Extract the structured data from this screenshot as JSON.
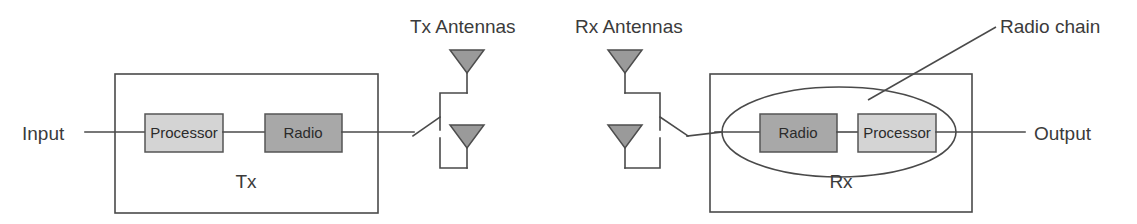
{
  "diagram": {
    "colors": {
      "background": "#ffffff",
      "line": "#4a4a4a",
      "text": "#3b3b3b",
      "processor_fill": "#d4d4d4",
      "radio_fill": "#a8a8a8",
      "antenna_fill": "#9a9a9a",
      "block_border": "#555555"
    }
  },
  "tx": {
    "input_label": "Input",
    "enclosure_label": "Tx",
    "antennas_label": "Tx Antennas",
    "blocks": [
      {
        "label": "Processor",
        "fill": "#d4d4d4"
      },
      {
        "label": "Radio",
        "fill": "#a8a8a8"
      }
    ],
    "antennas": [
      {
        "name": "tx-antenna-1"
      },
      {
        "name": "tx-antenna-2"
      }
    ]
  },
  "rx": {
    "output_label": "Output",
    "enclosure_label": "Rx",
    "antennas_label": "Rx Antennas",
    "chain_label": "Radio chain",
    "blocks": [
      {
        "label": "Radio",
        "fill": "#a8a8a8"
      },
      {
        "label": "Processor",
        "fill": "#d4d4d4"
      }
    ],
    "antennas": [
      {
        "name": "rx-antenna-1"
      },
      {
        "name": "rx-antenna-2"
      }
    ]
  }
}
